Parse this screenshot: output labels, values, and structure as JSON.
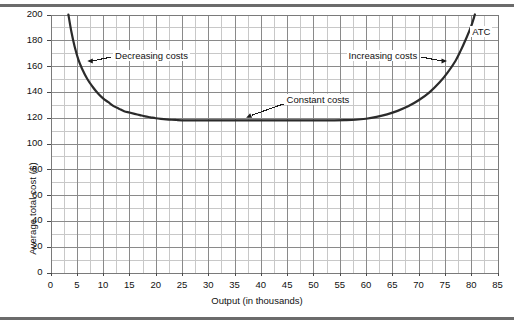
{
  "figure": {
    "background": "#ffffff",
    "rule_color": "#6b6b6b"
  },
  "chart_data": {
    "type": "line",
    "title": "",
    "xlabel": "Output (in thousands)",
    "ylabel": "Average total cost ($)",
    "xlim": [
      0,
      85
    ],
    "ylim": [
      0,
      200
    ],
    "grid": true,
    "legend": "none",
    "x_major_step": 5,
    "x_minor_step": 2.5,
    "y_major_step": 20,
    "y_minor_step": 10,
    "xticks": [
      "0",
      "5",
      "10",
      "15",
      "20",
      "25",
      "30",
      "35",
      "40",
      "45",
      "50",
      "55",
      "60",
      "65",
      "70",
      "75",
      "80",
      "85"
    ],
    "yticks": [
      "0",
      "20",
      "40",
      "60",
      "80",
      "100",
      "120",
      "140",
      "160",
      "180",
      "200"
    ],
    "series": [
      {
        "name": "ATC",
        "label": "ATC",
        "color": "#2b2b2b",
        "linewidth": 2.2,
        "points": [
          [
            3.4,
            200
          ],
          [
            4.0,
            186
          ],
          [
            4.6,
            175
          ],
          [
            5.3,
            165
          ],
          [
            6.0,
            158
          ],
          [
            7.0,
            150
          ],
          [
            8.0,
            144
          ],
          [
            9.0,
            139
          ],
          [
            10.0,
            135
          ],
          [
            11.0,
            132
          ],
          [
            12.0,
            129
          ],
          [
            13.0,
            127
          ],
          [
            14.0,
            125
          ],
          [
            15.0,
            124
          ],
          [
            16.0,
            123
          ],
          [
            17.0,
            122
          ],
          [
            18.0,
            121
          ],
          [
            19.0,
            120.3
          ],
          [
            20.0,
            119.6
          ],
          [
            21.0,
            119.1
          ],
          [
            22.0,
            118.7
          ],
          [
            23.0,
            118.4
          ],
          [
            24.0,
            118.2
          ],
          [
            25.0,
            118.0
          ],
          [
            30.0,
            118.0
          ],
          [
            35.0,
            118.0
          ],
          [
            40.0,
            118.0
          ],
          [
            45.0,
            118.0
          ],
          [
            50.0,
            118.0
          ],
          [
            54.0,
            118.0
          ],
          [
            56.0,
            118.1
          ],
          [
            58.0,
            118.4
          ],
          [
            60.0,
            119.2
          ],
          [
            62.0,
            120.6
          ],
          [
            64.0,
            122.6
          ],
          [
            66.0,
            125.3
          ],
          [
            68.0,
            128.8
          ],
          [
            70.0,
            133.5
          ],
          [
            72.0,
            139.5
          ],
          [
            74.0,
            147.5
          ],
          [
            75.5,
            155.0
          ],
          [
            77.0,
            164.0
          ],
          [
            78.0,
            172.0
          ],
          [
            79.0,
            181.0
          ],
          [
            80.0,
            191.0
          ],
          [
            80.7,
            200
          ]
        ]
      }
    ],
    "annotations": [
      {
        "id": "decreasing-costs",
        "text": "Decreasing costs",
        "text_x": 11.9,
        "text_y": 167,
        "arrow_tip_x": 7.0,
        "arrow_tip_y": 164,
        "arrow_dir": "left"
      },
      {
        "id": "constant-costs",
        "text": "Constant costs",
        "text_x": 44.5,
        "text_y": 133,
        "arrow_tip_x": 37.2,
        "arrow_tip_y": 120,
        "arrow_dir": "down-left"
      },
      {
        "id": "increasing-costs",
        "text": "Increasing costs",
        "text_x": 56.3,
        "text_y": 167,
        "arrow_tip_x": 75.4,
        "arrow_tip_y": 164,
        "arrow_dir": "right"
      },
      {
        "id": "atc-label",
        "text": "ATC",
        "text_x": 79.8,
        "text_y": 186,
        "arrow_dir": "none"
      }
    ]
  }
}
